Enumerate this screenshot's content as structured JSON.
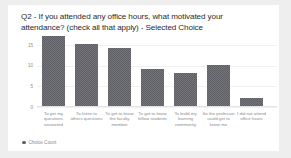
{
  "card": {
    "background": "#ffffff",
    "page_background": "#eeeeee"
  },
  "legend": {
    "marker_name": "legend-dot",
    "label": "Choice Count",
    "position": "bottom-left",
    "color": "#5f5f66"
  },
  "chart_data": {
    "type": "bar",
    "title": "Q2 - If you attended any office hours, what motivated your attendance? (check all that apply) - Selected Choice",
    "xlabel": "",
    "ylabel": "",
    "ylim": [
      0,
      17.5
    ],
    "grid": true,
    "legend": [
      "Choice Count"
    ],
    "bar_color": "#5f5f66",
    "yticks": [
      0,
      5,
      10,
      15
    ],
    "ytick_labels": [
      "0",
      "5",
      "10",
      "15"
    ],
    "categories": [
      "To get my questions answered",
      "To listen to others questions",
      "To get to know the faculty member",
      "To get to know fellow students",
      "To build my learning community",
      "So the professor could get to know me",
      "I did not attend office hours"
    ],
    "values": [
      17,
      15,
      14,
      9,
      8,
      10,
      2
    ],
    "series": [
      {
        "name": "Choice Count",
        "values": [
          17,
          15,
          14,
          9,
          8,
          10,
          2
        ]
      }
    ]
  }
}
